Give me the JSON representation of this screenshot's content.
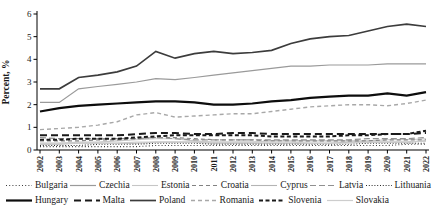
{
  "chart_data": {
    "type": "line",
    "title": "",
    "xlabel": "",
    "ylabel": "Percent, %",
    "ylim": [
      0,
      6
    ],
    "yticks": [
      0,
      1,
      2,
      3,
      4,
      5,
      6
    ],
    "grid": false,
    "legend_position": "bottom",
    "x": [
      2002,
      2003,
      2004,
      2005,
      2006,
      2007,
      2008,
      2009,
      2010,
      2011,
      2012,
      2013,
      2014,
      2015,
      2016,
      2017,
      2018,
      2019,
      2020,
      2021,
      2022
    ],
    "series": [
      {
        "name": "Bulgaria",
        "color": "#3a3a3a",
        "width": 1.1,
        "dash": "1,2.2",
        "values": [
          0.15,
          0.15,
          0.15,
          0.15,
          0.15,
          0.15,
          0.2,
          0.2,
          0.2,
          0.2,
          0.2,
          0.2,
          0.2,
          0.2,
          0.2,
          0.2,
          0.2,
          0.2,
          0.2,
          0.25,
          0.25
        ]
      },
      {
        "name": "Czechia",
        "color": "#9a9a9a",
        "width": 1.2,
        "dash": "",
        "values": [
          2.1,
          2.1,
          2.7,
          2.8,
          2.9,
          3.0,
          3.15,
          3.1,
          3.2,
          3.3,
          3.4,
          3.5,
          3.6,
          3.7,
          3.7,
          3.75,
          3.75,
          3.75,
          3.8,
          3.8,
          3.8
        ]
      },
      {
        "name": "Estonia",
        "color": "#c6c6c6",
        "width": 1.1,
        "dash": "",
        "values": [
          0.3,
          0.3,
          0.35,
          0.35,
          0.4,
          0.45,
          0.5,
          0.5,
          0.4,
          0.35,
          0.35,
          0.35,
          0.4,
          0.4,
          0.4,
          0.4,
          0.4,
          0.4,
          0.45,
          0.45,
          0.5
        ]
      },
      {
        "name": "Croatia",
        "color": "#828282",
        "width": 1.2,
        "dash": "4,3",
        "values": [
          0.4,
          0.4,
          0.4,
          0.45,
          0.45,
          0.5,
          0.55,
          0.55,
          0.5,
          0.45,
          0.45,
          0.45,
          0.4,
          0.4,
          0.4,
          0.4,
          0.4,
          0.4,
          0.45,
          0.45,
          0.45
        ]
      },
      {
        "name": "Cyprus",
        "color": "#b4b4b4",
        "width": 1.1,
        "dash": "",
        "values": [
          0.25,
          0.25,
          0.3,
          0.3,
          0.3,
          0.3,
          0.35,
          0.35,
          0.35,
          0.3,
          0.3,
          0.3,
          0.3,
          0.3,
          0.3,
          0.3,
          0.35,
          0.35,
          0.35,
          0.35,
          0.4
        ]
      },
      {
        "name": "Latvia",
        "color": "#909090",
        "width": 1.2,
        "dash": "6,3",
        "values": [
          0.55,
          0.5,
          0.5,
          0.5,
          0.5,
          0.5,
          0.55,
          0.5,
          0.45,
          0.45,
          0.45,
          0.45,
          0.45,
          0.45,
          0.45,
          0.45,
          0.45,
          0.5,
          0.5,
          0.5,
          0.55
        ]
      },
      {
        "name": "Lithuania",
        "color": "#2a2a2a",
        "width": 1.1,
        "dash": "1,1.8",
        "values": [
          0.2,
          0.2,
          0.2,
          0.25,
          0.25,
          0.25,
          0.3,
          0.3,
          0.3,
          0.25,
          0.25,
          0.25,
          0.25,
          0.25,
          0.25,
          0.25,
          0.25,
          0.3,
          0.3,
          0.3,
          0.3
        ]
      },
      {
        "name": "Hungary",
        "color": "#0d0d0d",
        "width": 2.2,
        "dash": "",
        "values": [
          1.7,
          1.85,
          1.95,
          2.0,
          2.05,
          2.1,
          2.15,
          2.15,
          2.1,
          2.0,
          2.0,
          2.05,
          2.15,
          2.2,
          2.3,
          2.35,
          2.4,
          2.4,
          2.5,
          2.4,
          2.55
        ]
      },
      {
        "name": "Malta",
        "color": "#1a1a1a",
        "width": 2,
        "dash": "7,4",
        "values": [
          0.65,
          0.65,
          0.65,
          0.65,
          0.65,
          0.7,
          0.75,
          0.75,
          0.7,
          0.7,
          0.75,
          0.75,
          0.7,
          0.7,
          0.7,
          0.7,
          0.7,
          0.7,
          0.7,
          0.7,
          0.75
        ]
      },
      {
        "name": "Poland",
        "color": "#3c3c3c",
        "width": 1.7,
        "dash": "",
        "values": [
          2.7,
          2.7,
          3.2,
          3.3,
          3.45,
          3.7,
          4.35,
          4.05,
          4.25,
          4.35,
          4.25,
          4.3,
          4.4,
          4.7,
          4.9,
          5.0,
          5.05,
          5.25,
          5.45,
          5.55,
          5.45
        ]
      },
      {
        "name": "Romania",
        "color": "#a8a8a8",
        "width": 1.4,
        "dash": "4,3",
        "values": [
          0.9,
          0.95,
          1.0,
          1.1,
          1.25,
          1.55,
          1.65,
          1.45,
          1.5,
          1.55,
          1.6,
          1.6,
          1.7,
          1.8,
          1.9,
          1.95,
          2.0,
          2.0,
          1.95,
          2.05,
          2.2
        ]
      },
      {
        "name": "Slovenia",
        "color": "#1a1a1a",
        "width": 2,
        "dash": "4,2.5",
        "values": [
          0.45,
          0.45,
          0.5,
          0.5,
          0.5,
          0.55,
          0.6,
          0.65,
          0.65,
          0.65,
          0.65,
          0.65,
          0.6,
          0.6,
          0.6,
          0.6,
          0.65,
          0.65,
          0.7,
          0.7,
          0.85
        ]
      },
      {
        "name": "Slovakia",
        "color": "#cdcdcd",
        "width": 1.2,
        "dash": "",
        "values": [
          0.3,
          0.3,
          0.3,
          0.3,
          0.3,
          0.35,
          0.35,
          0.35,
          0.35,
          0.35,
          0.35,
          0.35,
          0.35,
          0.35,
          0.3,
          0.3,
          0.3,
          0.35,
          0.35,
          0.35,
          0.4
        ]
      }
    ]
  },
  "legend": {
    "rows": [
      [
        "Bulgaria",
        "Czechia",
        "Estonia",
        "Croatia",
        "Cyprus",
        "Latvia",
        "Lithuania"
      ],
      [
        "Hungary",
        "Malta",
        "Poland",
        "Romania",
        "Slovenia",
        "Slovakia"
      ]
    ]
  }
}
